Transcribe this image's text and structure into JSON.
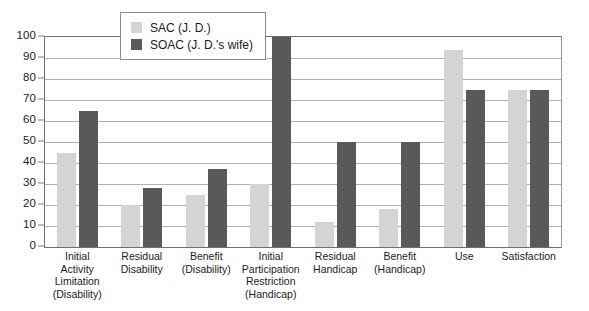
{
  "chart_data": {
    "type": "bar",
    "title": "",
    "subtitle": "",
    "xlabel": "",
    "ylabel": "",
    "ylim": [
      0,
      100
    ],
    "ytick_step": 10,
    "yticks": [
      "100",
      "90",
      "80",
      "70",
      "60",
      "50",
      "40",
      "30",
      "20",
      "10",
      "0"
    ],
    "grid": true,
    "legend_position": "inside-top-left",
    "orientation": "vertical",
    "grouping": "grouped",
    "categories": [
      "Initial Activity Limitation (Disability)",
      "Residual Disability",
      "Benefit (Disability)",
      "Initial Participation Restriction (Handicap)",
      "Residual Handicap",
      "Benefit (Handicap)",
      "Use",
      "Satisfaction"
    ],
    "category_label_lines": [
      [
        "Initial",
        "Activity",
        "Limitation",
        "(Disability)"
      ],
      [
        "Residual",
        "Disability"
      ],
      [
        "Benefit",
        "(Disability)"
      ],
      [
        "Initial",
        "Participation",
        "Restriction",
        "(Handicap)"
      ],
      [
        "Residual",
        "Handicap"
      ],
      [
        "Benefit",
        "(Handicap)"
      ],
      [
        "Use"
      ],
      [
        "Satisfaction"
      ]
    ],
    "series": [
      {
        "name": "SAC (J. D.)",
        "color": "#d4d4d4",
        "values": [
          45,
          20,
          25,
          30,
          12,
          18,
          94,
          75
        ]
      },
      {
        "name": "SOAC (J. D.'s wife)",
        "color": "#595959",
        "values": [
          65,
          28,
          37,
          100,
          50,
          50,
          75,
          75
        ]
      }
    ]
  },
  "legend": {
    "items": [
      {
        "label": "SAC (J. D.)",
        "color": "#d4d4d4"
      },
      {
        "label": "SOAC (J. D.'s wife)",
        "color": "#595959"
      }
    ]
  },
  "colors": {
    "sac": "#d4d4d4",
    "soac": "#595959",
    "gridline": "#b0b0b0",
    "axis": "#6f6f6f",
    "text": "#1b1b1b",
    "background": "#ffffff"
  }
}
